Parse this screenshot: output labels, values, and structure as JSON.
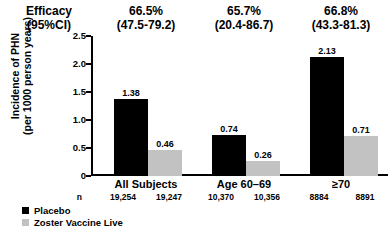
{
  "chart_data": {
    "type": "bar",
    "title": "",
    "xlabel": "",
    "ylabel_line1": "Incidence of PHN",
    "ylabel_line2": "(per 1000 person years)",
    "ylim": [
      0,
      2.5
    ],
    "yticks": [
      "0",
      "0.5",
      "1.0",
      "1.5",
      "2.0",
      "2.5"
    ],
    "ytick_values": [
      0,
      0.5,
      1.0,
      1.5,
      2.0,
      2.5
    ],
    "grid": false,
    "legend_position": "bottom-left",
    "categories": [
      "All Subjects",
      "Age 60–69",
      "≥70"
    ],
    "series": [
      {
        "name": "Placebo",
        "color": "#000000",
        "values": [
          1.38,
          0.74,
          2.13
        ],
        "labels": [
          "1.38",
          "0.74",
          "2.13"
        ]
      },
      {
        "name": "Zoster Vaccine Live",
        "color": "#c2c2c2",
        "values": [
          0.46,
          0.26,
          0.71
        ],
        "labels": [
          "0.46",
          "0.26",
          "0.71"
        ]
      }
    ],
    "efficacy_header_label_line1": "Efficacy",
    "efficacy_header_label_line2": "(95%CI)",
    "efficacy": [
      {
        "percent": "66.5%",
        "ci": "(47.5-79.2)"
      },
      {
        "percent": "65.7%",
        "ci": "(20.4-86.7)"
      },
      {
        "percent": "66.8%",
        "ci": "(43.3-81.3)"
      }
    ],
    "n_row_label": "n",
    "n_values": [
      {
        "placebo": "19,254",
        "vaccine": "19,247"
      },
      {
        "placebo": "10,370",
        "vaccine": "10,356"
      },
      {
        "placebo": "8884",
        "vaccine": "8891"
      }
    ]
  }
}
